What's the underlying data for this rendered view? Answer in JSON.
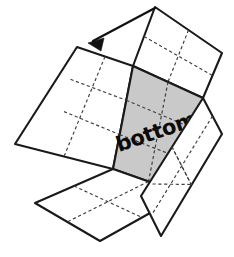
{
  "diagram": {
    "kind": "box-net-fold-diagram",
    "canvas": {
      "width": 234,
      "height": 257
    },
    "background_color": "#ffffff",
    "line_color": "#1a1a1a",
    "dash_color": "#3d3d3d",
    "shade_color": "#c9c9c9",
    "arrow_color": "#111111",
    "labels": {
      "bottom_face": "bottom"
    },
    "label_rotation_deg": -19,
    "panels": [
      {
        "name": "top-right-flap",
        "shaded": false,
        "grid_cols": 2,
        "grid_rows": 2,
        "points": "155,7 222,53 203,98 133,66"
      },
      {
        "name": "left-panel",
        "shaded": false,
        "grid_cols": 2,
        "grid_rows": 3,
        "points": "77,47 133,66 113,169 15,144"
      },
      {
        "name": "bottom-face-shaded",
        "shaded": true,
        "grid_cols": 2,
        "grid_rows": 3,
        "points": "133,66 203,98 184,194 113,169"
      },
      {
        "name": "bottom-left-flap",
        "shaded": false,
        "grid_cols": 2,
        "grid_rows": 2,
        "points": "113,169 184,194 100,241 35,203"
      },
      {
        "name": "right-flap",
        "shaded": false,
        "grid_cols": 2,
        "grid_rows": 2,
        "points": "203,98 222,134 161,236 141,196"
      }
    ],
    "arrow": {
      "name": "fold-direction-arrow",
      "from": {
        "x": 155,
        "y": 8
      },
      "to": {
        "x": 88,
        "y": 43
      },
      "head_points": "88,43 104,38 101,51"
    }
  }
}
